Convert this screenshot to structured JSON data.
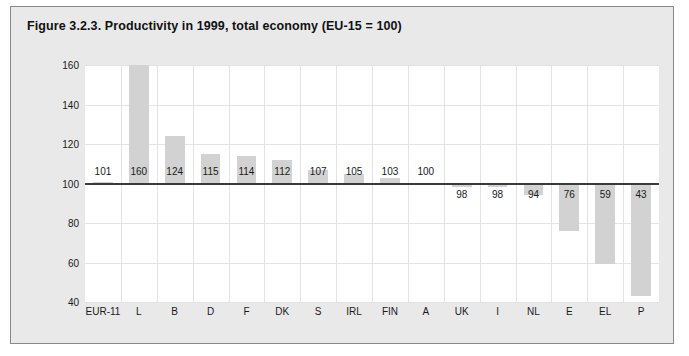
{
  "figure": {
    "title": "Figure 3.2.3. Productivity in 1999, total economy (EU-15 = 100)"
  },
  "chart_data": {
    "type": "bar",
    "title": "Figure 3.2.3. Productivity in 1999, total economy (EU-15 = 100)",
    "xlabel": "",
    "ylabel": "",
    "ylim": [
      40,
      160
    ],
    "yticks": [
      40,
      60,
      80,
      100,
      120,
      140,
      160
    ],
    "baseline": 100,
    "grid": true,
    "legend": null,
    "bar_color": "#d2d2d2",
    "baseline_color": "#3a3a3a",
    "categories": [
      "EUR-11",
      "L",
      "B",
      "D",
      "F",
      "DK",
      "S",
      "IRL",
      "FIN",
      "A",
      "UK",
      "I",
      "NL",
      "E",
      "EL",
      "P"
    ],
    "values": [
      101,
      160,
      124,
      115,
      114,
      112,
      107,
      105,
      103,
      100,
      98,
      98,
      94,
      76,
      59,
      43
    ],
    "labels": [
      "101",
      "160",
      "124",
      "115",
      "114",
      "112",
      "107",
      "105",
      "103",
      "100",
      "98",
      "98",
      "94",
      "76",
      "59",
      "43"
    ]
  }
}
